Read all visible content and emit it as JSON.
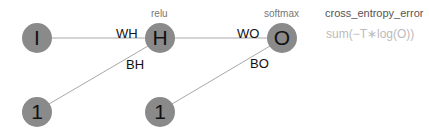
{
  "nodes": {
    "input": "I",
    "hidden": "H",
    "output": "O",
    "bias_hidden": "1",
    "bias_output": "1"
  },
  "edges": {
    "wh": "WH",
    "bh": "BH",
    "wo": "WO",
    "bo": "BO"
  },
  "activations": {
    "hidden": "relu",
    "output": "softmax"
  },
  "loss": {
    "name": "cross_entropy_error",
    "formula": "sum(−T∗log(O))"
  },
  "colors": {
    "node_fill": "#8a8a8a",
    "edge": "#9a9a9a"
  }
}
